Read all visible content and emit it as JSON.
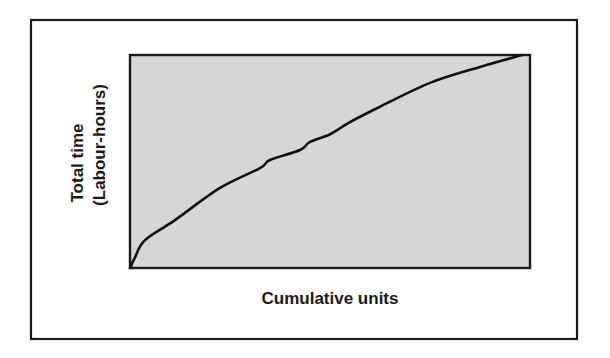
{
  "chart_data": {
    "type": "line",
    "title": "",
    "xlabel": "Cumulative units",
    "ylabel_lines": [
      "Total time",
      "(Labour-hours)"
    ],
    "ylabel": "Total time (Labour-hours)",
    "x_ticks": [],
    "y_ticks": [],
    "grid": false,
    "legend": "none",
    "xlim": [
      0,
      1
    ],
    "ylim": [
      0,
      1
    ],
    "series": [
      {
        "name": "Cumulative total time",
        "x": [
          0,
          0.0125,
          0.0375,
          0.1125,
          0.225,
          0.325,
          0.35,
          0.425,
          0.45,
          0.5,
          0.55,
          0.625,
          0.75,
          0.875,
          0.98
        ],
        "y": [
          0,
          0.05,
          0.131,
          0.225,
          0.376,
          0.469,
          0.507,
          0.554,
          0.592,
          0.628,
          0.685,
          0.757,
          0.869,
          0.944,
          1.0
        ]
      }
    ],
    "plot_fill_color": "#d6d6d6",
    "line_color": "#111111"
  }
}
